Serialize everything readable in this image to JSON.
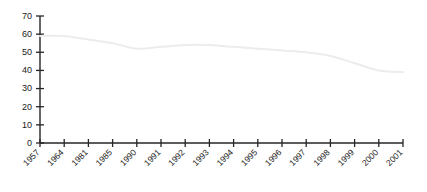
{
  "chart_data": {
    "type": "line",
    "title": "",
    "xlabel": "",
    "ylabel": "",
    "categories": [
      "1957",
      "1964",
      "1981",
      "1985",
      "1990",
      "1991",
      "1992",
      "1993",
      "1994",
      "1995",
      "1996",
      "1997",
      "1998",
      "1999",
      "2000",
      "2001"
    ],
    "values": [
      59,
      59,
      57,
      55,
      52,
      53,
      54,
      54,
      53,
      52,
      51,
      50,
      48,
      44,
      40,
      39
    ],
    "series": [
      {
        "name": "",
        "values": [
          59,
          59,
          57,
          55,
          52,
          53,
          54,
          54,
          53,
          52,
          51,
          50,
          48,
          44,
          40,
          39
        ]
      }
    ],
    "ylim": [
      0,
      70
    ],
    "yticks": [
      0,
      10,
      20,
      30,
      40,
      50,
      60,
      70
    ],
    "ytick_labels": [
      "0",
      "10",
      "20",
      "30",
      "40",
      "50",
      "60",
      "70"
    ],
    "grid": false,
    "legend": false,
    "legend_position": "none",
    "line_color": "#ececec",
    "axis_color": "#262626",
    "background_color": "#ffffff",
    "xtick_rotation": 45
  }
}
